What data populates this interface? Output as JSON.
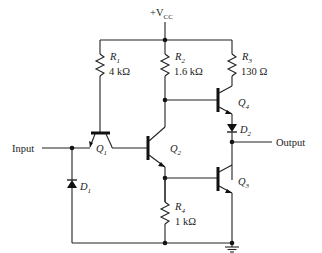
{
  "supply": {
    "label_prefix": "+V",
    "label_sub": "CC"
  },
  "resistors": [
    {
      "id": "R1",
      "name": "R",
      "sub": "1",
      "value": "4 kΩ"
    },
    {
      "id": "R2",
      "name": "R",
      "sub": "2",
      "value": "1.6 kΩ"
    },
    {
      "id": "R3",
      "name": "R",
      "sub": "3",
      "value": "130 Ω"
    },
    {
      "id": "R4",
      "name": "R",
      "sub": "4",
      "value": "1 kΩ"
    }
  ],
  "transistors": [
    {
      "id": "Q1",
      "name": "Q",
      "sub": "1"
    },
    {
      "id": "Q2",
      "name": "Q",
      "sub": "2"
    },
    {
      "id": "Q3",
      "name": "Q",
      "sub": "3"
    },
    {
      "id": "Q4",
      "name": "Q",
      "sub": "4"
    }
  ],
  "diodes": [
    {
      "id": "D1",
      "name": "D",
      "sub": "1"
    },
    {
      "id": "D2",
      "name": "D",
      "sub": "2"
    }
  ],
  "ports": {
    "input": "Input",
    "output": "Output"
  }
}
